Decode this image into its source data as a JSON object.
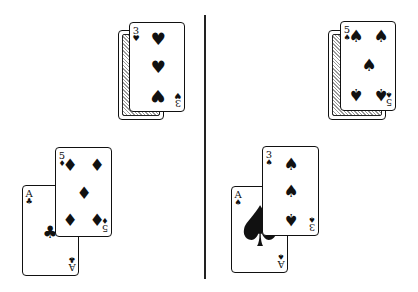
{
  "divider": {
    "orientation": "vertical"
  },
  "hands": [
    {
      "side": "left",
      "stock": {
        "back": "card-back",
        "top_card": {
          "rank": "3",
          "suit": "♥",
          "suit_name": "hearts"
        }
      },
      "hand": [
        {
          "rank": "A",
          "suit": "♣",
          "suit_name": "clubs"
        },
        {
          "rank": "5",
          "suit": "♦",
          "suit_name": "diamonds"
        }
      ]
    },
    {
      "side": "right",
      "stock": {
        "back": "card-back",
        "top_card": {
          "rank": "5",
          "suit": "♠",
          "suit_name": "spades"
        }
      },
      "hand": [
        {
          "rank": "A",
          "suit": "♠",
          "suit_name": "spades"
        },
        {
          "rank": "3",
          "suit": "♠",
          "suit_name": "spades"
        }
      ]
    }
  ]
}
